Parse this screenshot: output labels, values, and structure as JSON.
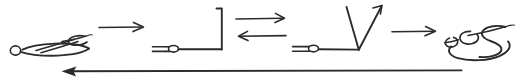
{
  "figure": {
    "kind": "hand-drawn-reaction-scheme",
    "width": 522,
    "height": 82,
    "background_color": "#ffffff",
    "ink_color": "#2b2b2b"
  },
  "nodes": [
    {
      "id": "node-1",
      "name": "scribble-loop-structure-left",
      "description": "cursive scribble with small open circle at its left end",
      "x": 8,
      "y": 33,
      "width": 88,
      "height": 26
    },
    {
      "id": "node-2",
      "name": "rod-with-bracket-structure",
      "description": "horizontal rod bearing a small oval, joined to a right square bracket",
      "x": 152,
      "y": 8,
      "width": 72,
      "height": 46
    },
    {
      "id": "node-3",
      "name": "rod-with-vee-structure",
      "description": "horizontal rod bearing a small oval, joined to an upward V with arrow tip",
      "x": 292,
      "y": 6,
      "width": 98,
      "height": 48
    },
    {
      "id": "node-4",
      "name": "scribble-loop-structure-right",
      "description": "cursive scribble resembling interlocked loops",
      "x": 444,
      "y": 22,
      "width": 74,
      "height": 38
    }
  ],
  "connectors": [
    {
      "id": "arrow-1",
      "name": "forward-arrow-1",
      "glyph": "right-arrow",
      "direction": "right",
      "label": "",
      "x1": 98,
      "y1": 27,
      "x2": 148,
      "y2": 27
    },
    {
      "id": "arrow-2",
      "name": "equilibrium-arrow-pair",
      "glyph": "equilibrium-arrows",
      "direction": "bidirectional",
      "label": "",
      "x1": 234,
      "y1": 18,
      "x2": 288,
      "y2": 36
    },
    {
      "id": "arrow-3",
      "name": "forward-arrow-2",
      "glyph": "right-arrow",
      "direction": "right",
      "label": "",
      "x1": 392,
      "y1": 31,
      "x2": 438,
      "y2": 31
    },
    {
      "id": "arrow-4",
      "name": "return-arrow-bottom",
      "glyph": "left-arrow-long",
      "direction": "left",
      "label": "",
      "x1": 62,
      "y1": 71,
      "x2": 462,
      "y2": 71
    }
  ],
  "labels": {
    "alt_text": "Four hand-drawn structures connected left to right by a plain arrow, an equilibrium arrow pair and a plain arrow, with a long arrow returning from right to left beneath them.",
    "caption": ""
  }
}
